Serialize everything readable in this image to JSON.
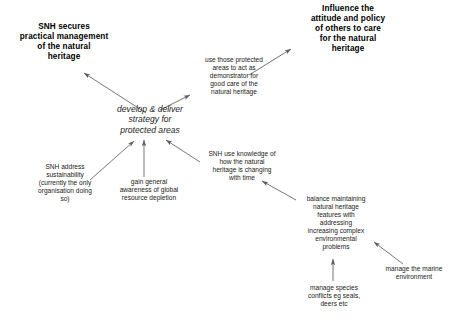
{
  "diagram": {
    "background_color": "#ffffff",
    "line_color": "#5a5a5a",
    "text_color": "#111111",
    "nodes": {
      "goal_management": "SNH secures\npractical management\nof the natural\nheritage",
      "goal_influence": "Influence the\nattitude and policy\nof others to care\nfor the natural\nheritage",
      "center_strategy": "develop & deliver\nstrategy for\nprotected areas",
      "demonstrator": "use those protected\nareas to act as\ndemonstrator for\ngood care of the\nnatural heritage",
      "sustainability": "SNH address\nsustainability\n(currently the only\norganisation doing\nso)",
      "awareness": "gain general\nawareness of global\nresource depletion",
      "knowledge": "SNH use knowledge of\nhow the natural\nheritage is changing\nwith time",
      "balance": "balance maintaining\nnatural heritage\nfeatures with\naddressing\nincreasing complex\nenvironmental\nproblems",
      "species": "manage species\nconflicts eg seals,\ndeers etc",
      "marine": "manage the marine\nenvironment"
    },
    "edges": [
      {
        "id": "strategy-to-management",
        "from": "center_strategy",
        "to": "goal_management"
      },
      {
        "id": "strategy-to-demonstrator",
        "from": "center_strategy",
        "to": "demonstrator"
      },
      {
        "id": "demonstrator-to-influence",
        "from": "demonstrator",
        "to": "goal_influence"
      },
      {
        "id": "sustainability-to-strategy",
        "from": "sustainability",
        "to": "center_strategy"
      },
      {
        "id": "awareness-to-strategy",
        "from": "awareness",
        "to": "center_strategy"
      },
      {
        "id": "knowledge-to-strategy",
        "from": "knowledge",
        "to": "center_strategy"
      },
      {
        "id": "balance-to-knowledge",
        "from": "balance",
        "to": "knowledge"
      },
      {
        "id": "species-to-balance",
        "from": "species",
        "to": "balance"
      },
      {
        "id": "marine-to-balance",
        "from": "marine",
        "to": "balance"
      }
    ]
  }
}
